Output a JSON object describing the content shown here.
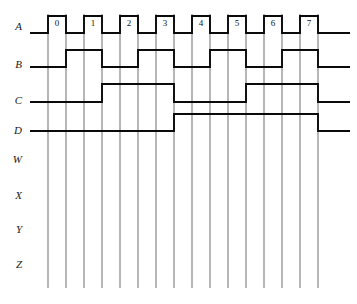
{
  "figure": {
    "type": "digital-timing-diagram"
  },
  "geometry": {
    "grid_x_start": 48,
    "grid_spacing": 18,
    "grid_count": 16,
    "grid_y_top": 14,
    "grid_y_bottom": 288,
    "lead_x_start": 30,
    "tail_x_end": 350,
    "label_x": 12
  },
  "signals": [
    {
      "name": "A",
      "label": "A",
      "label_y": 30,
      "high_y": 16,
      "low_y": 33,
      "has_lead": true,
      "has_wave": true,
      "lead_level": "low",
      "transitions": [
        48,
        66,
        84,
        102,
        120,
        138,
        156,
        174,
        192,
        210,
        228,
        246,
        264,
        282,
        300,
        318
      ],
      "start_level": "low"
    },
    {
      "name": "B",
      "label": "B",
      "label_y": 68,
      "high_y": 50,
      "low_y": 67,
      "has_lead": true,
      "has_wave": true,
      "lead_level": "low",
      "transitions": [
        66,
        102,
        138,
        174,
        210,
        246,
        282,
        318
      ],
      "start_level": "low"
    },
    {
      "name": "C",
      "label": "C",
      "label_y": 104,
      "high_y": 84,
      "low_y": 102,
      "has_lead": true,
      "has_wave": true,
      "lead_level": "low",
      "transitions": [
        102,
        174,
        246,
        318
      ],
      "start_level": "low"
    },
    {
      "name": "D",
      "label": "D",
      "label_y": 134,
      "high_y": 114,
      "low_y": 131,
      "has_lead": true,
      "has_wave": true,
      "lead_level": "low",
      "transitions": [
        174,
        318
      ],
      "start_level": "low"
    },
    {
      "name": "W",
      "label": "W",
      "label_y": 163,
      "high_y": 158,
      "low_y": 163,
      "has_lead": false,
      "has_wave": false,
      "lead_level": "none",
      "transitions": [],
      "start_level": "none"
    },
    {
      "name": "X",
      "label": "X",
      "label_y": 199,
      "high_y": 194,
      "low_y": 199,
      "has_lead": false,
      "has_wave": false,
      "lead_level": "none",
      "transitions": [],
      "start_level": "none"
    },
    {
      "name": "Y",
      "label": "Y",
      "label_y": 233,
      "high_y": 228,
      "low_y": 233,
      "has_lead": false,
      "has_wave": false,
      "lead_level": "none",
      "transitions": [],
      "start_level": "none"
    },
    {
      "name": "Z",
      "label": "Z",
      "label_y": 268,
      "high_y": 263,
      "low_y": 268,
      "has_lead": false,
      "has_wave": false,
      "lead_level": "none",
      "transitions": [],
      "start_level": "none"
    }
  ],
  "pulse_numbers": [
    {
      "text": "0",
      "x": 57,
      "y": 24
    },
    {
      "text": "1",
      "x": 93,
      "y": 24
    },
    {
      "text": "2",
      "x": 129,
      "y": 24
    },
    {
      "text": "3",
      "x": 165,
      "y": 24
    },
    {
      "text": "4",
      "x": 201,
      "y": 24
    },
    {
      "text": "5",
      "x": 237,
      "y": 24
    },
    {
      "text": "6",
      "x": 273,
      "y": 24
    },
    {
      "text": "7",
      "x": 309,
      "y": 24
    }
  ],
  "colors": {
    "waveform": "#0a0a0a",
    "gridline": "#4a4a4a",
    "background": "#ffffff",
    "label_text": "#1a1a1a"
  }
}
